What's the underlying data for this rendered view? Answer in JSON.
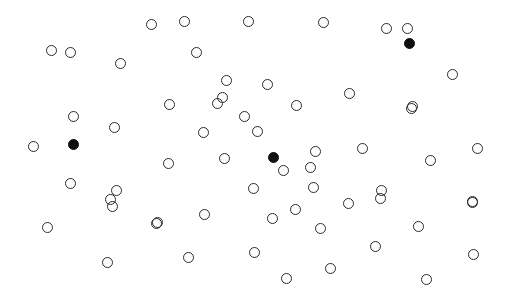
{
  "canvas": {
    "width": 523,
    "height": 306,
    "background_color": "#ffffff",
    "title": "Scattered circle pattern"
  },
  "style": {
    "open_stroke_color": "#2b2b2b",
    "open_fill_color": "transparent",
    "filled_color": "#101010",
    "open_diameter": 11,
    "filled_diameter": 11,
    "stroke_width": 1.6
  },
  "legend": {
    "open_label": "open circle",
    "filled_label": "filled circle"
  },
  "chart_data": {
    "type": "scatter",
    "xlabel": "",
    "ylabel": "",
    "xlim": [
      0,
      523
    ],
    "ylim": [
      0,
      306
    ],
    "grid": false,
    "legend_position": "none",
    "counts": {
      "open": 66,
      "filled": 3,
      "total": 69
    },
    "series": [
      {
        "name": "open circle",
        "marker": "o",
        "filled": false,
        "color": "#2b2b2b",
        "size": 11,
        "points": [
          [
            151,
            24
          ],
          [
            184,
            21
          ],
          [
            248,
            21
          ],
          [
            323,
            22
          ],
          [
            386,
            28
          ],
          [
            407,
            28
          ],
          [
            51,
            50
          ],
          [
            70,
            52
          ],
          [
            196,
            52
          ],
          [
            120,
            63
          ],
          [
            452,
            74
          ],
          [
            226,
            80
          ],
          [
            267,
            84
          ],
          [
            349,
            93
          ],
          [
            222,
            97
          ],
          [
            169,
            104
          ],
          [
            217,
            103
          ],
          [
            296,
            105
          ],
          [
            412,
            106
          ],
          [
            411,
            108
          ],
          [
            244,
            116
          ],
          [
            73,
            116
          ],
          [
            114,
            127
          ],
          [
            203,
            132
          ],
          [
            257,
            131
          ],
          [
            33,
            146
          ],
          [
            362,
            148
          ],
          [
            477,
            148
          ],
          [
            315,
            151
          ],
          [
            224,
            158
          ],
          [
            168,
            163
          ],
          [
            310,
            167
          ],
          [
            430,
            160
          ],
          [
            283,
            170
          ],
          [
            70,
            183
          ],
          [
            381,
            190
          ],
          [
            313,
            187
          ],
          [
            253,
            188
          ],
          [
            116,
            190
          ],
          [
            110,
            199
          ],
          [
            112,
            206
          ],
          [
            472,
            201
          ],
          [
            348,
            203
          ],
          [
            380,
            198
          ],
          [
            472,
            202
          ],
          [
            204,
            214
          ],
          [
            295,
            209
          ],
          [
            47,
            227
          ],
          [
            157,
            222
          ],
          [
            156,
            223
          ],
          [
            272,
            218
          ],
          [
            320,
            228
          ],
          [
            418,
            226
          ],
          [
            188,
            257
          ],
          [
            254,
            252
          ],
          [
            107,
            262
          ],
          [
            375,
            246
          ],
          [
            473,
            254
          ],
          [
            286,
            278
          ],
          [
            330,
            268
          ],
          [
            426,
            279
          ]
        ]
      },
      {
        "name": "filled circle",
        "marker": "o",
        "filled": true,
        "color": "#101010",
        "size": 11,
        "points": [
          [
            409,
            43
          ],
          [
            73,
            144
          ],
          [
            273,
            157
          ]
        ]
      }
    ]
  }
}
